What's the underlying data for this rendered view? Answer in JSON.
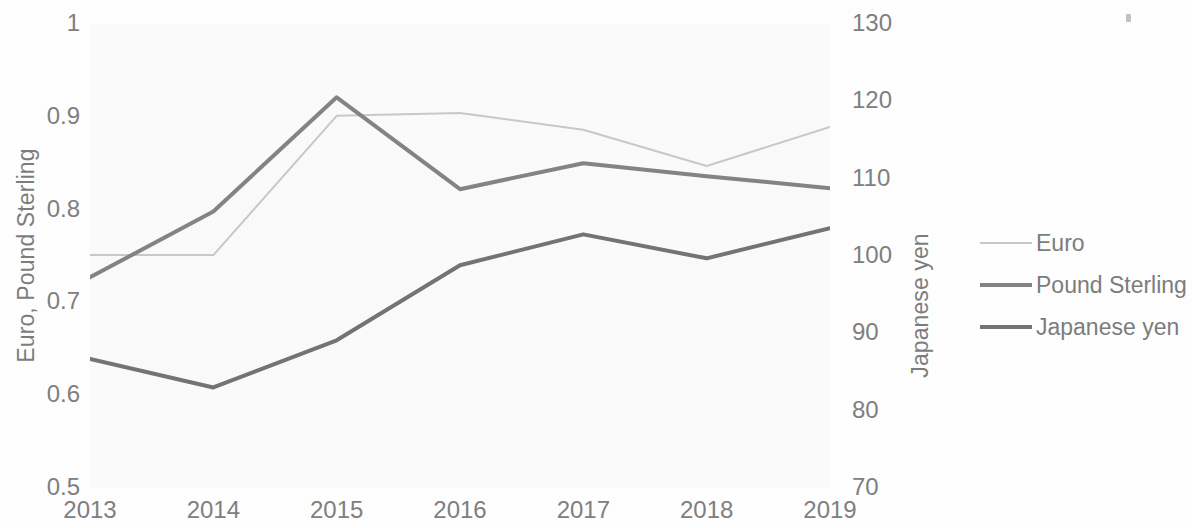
{
  "chart_data": {
    "type": "line",
    "title": "",
    "xlabel": "",
    "categories": [
      "2013",
      "2014",
      "2015",
      "2016",
      "2017",
      "2018",
      "2019"
    ],
    "grid": false,
    "legend_position": "right",
    "axes": {
      "left": {
        "label": "Euro, Pound Sterling",
        "ticks": [
          "0.5",
          "0.6",
          "0.7",
          "0.8",
          "0.9",
          "1"
        ],
        "tick_values": [
          0.5,
          0.6,
          0.7,
          0.8,
          0.9,
          1
        ],
        "range": [
          0.5,
          1
        ]
      },
      "right": {
        "label": "Japanese yen",
        "ticks": [
          "70",
          "80",
          "90",
          "100",
          "110",
          "120",
          "130"
        ],
        "tick_values": [
          70,
          80,
          90,
          100,
          110,
          120,
          130
        ],
        "range": [
          70,
          130
        ]
      }
    },
    "series": [
      {
        "name": "Euro",
        "axis": "left",
        "color": "#c9c9c9",
        "width": 2,
        "values": [
          0.751,
          0.751,
          0.901,
          0.904,
          0.886,
          0.847,
          0.889
        ]
      },
      {
        "name": "Pound Sterling",
        "axis": "left",
        "color": "#848484",
        "width": 4,
        "values": [
          0.727,
          0.798,
          0.921,
          0.822,
          0.85,
          0.836,
          0.823
        ]
      },
      {
        "name": "Japanese yen",
        "axis": "right",
        "color": "#747474",
        "width": 4,
        "values": [
          86.7,
          83.0,
          89.1,
          98.8,
          102.8,
          99.7,
          103.6
        ]
      }
    ]
  },
  "legend": {
    "items": [
      {
        "label": "Euro",
        "color": "#c9c9c9",
        "width": 2
      },
      {
        "label": "Pound Sterling",
        "color": "#848484",
        "width": 4
      },
      {
        "label": "Japanese yen",
        "color": "#747474",
        "width": 4
      }
    ]
  },
  "colors": {
    "euro": "#c9c9c9",
    "pound_sterling": "#848484",
    "japanese_yen": "#747474",
    "text": "#808080",
    "plot_background": "#fbfbfb",
    "page_background": "#ffffff"
  }
}
